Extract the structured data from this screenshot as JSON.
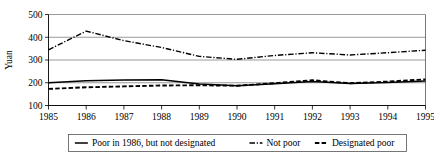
{
  "chart_data": {
    "type": "line",
    "title": "",
    "xlabel": "",
    "ylabel": "Yuan",
    "x": [
      1985,
      1986,
      1987,
      1988,
      1989,
      1990,
      1991,
      1992,
      1993,
      1994,
      1995
    ],
    "xtick_labels": [
      "1985",
      "1986",
      "1987",
      "1988",
      "1989",
      "1990",
      "1991",
      "1992",
      "1993",
      "1994",
      "1995"
    ],
    "ytick_labels": [
      "100",
      "200",
      "300",
      "400",
      "500"
    ],
    "yticks": [
      100,
      200,
      300,
      400,
      500
    ],
    "ylim": [
      100,
      500
    ],
    "xlim": [
      1985,
      1995
    ],
    "grid": true,
    "legend_position": "bottom",
    "series": [
      {
        "name": "Poor in 1986, but not designated",
        "style": "solid",
        "values": [
          200,
          209,
          212,
          213,
          195,
          187,
          196,
          205,
          197,
          201,
          208
        ]
      },
      {
        "name": "Not poor",
        "style": "dash-dot",
        "values": [
          345,
          427,
          385,
          355,
          316,
          303,
          320,
          332,
          322,
          332,
          343
        ]
      },
      {
        "name": "Designated poor",
        "style": "dashed",
        "values": [
          173,
          180,
          184,
          188,
          189,
          187,
          198,
          211,
          198,
          205,
          215
        ]
      }
    ]
  },
  "legend": {
    "items": [
      {
        "label": "Poor in 1986, but not designated",
        "style": "solid"
      },
      {
        "label": "Not poor",
        "style": "dash-dot"
      },
      {
        "label": "Designated poor",
        "style": "dashed"
      }
    ]
  }
}
